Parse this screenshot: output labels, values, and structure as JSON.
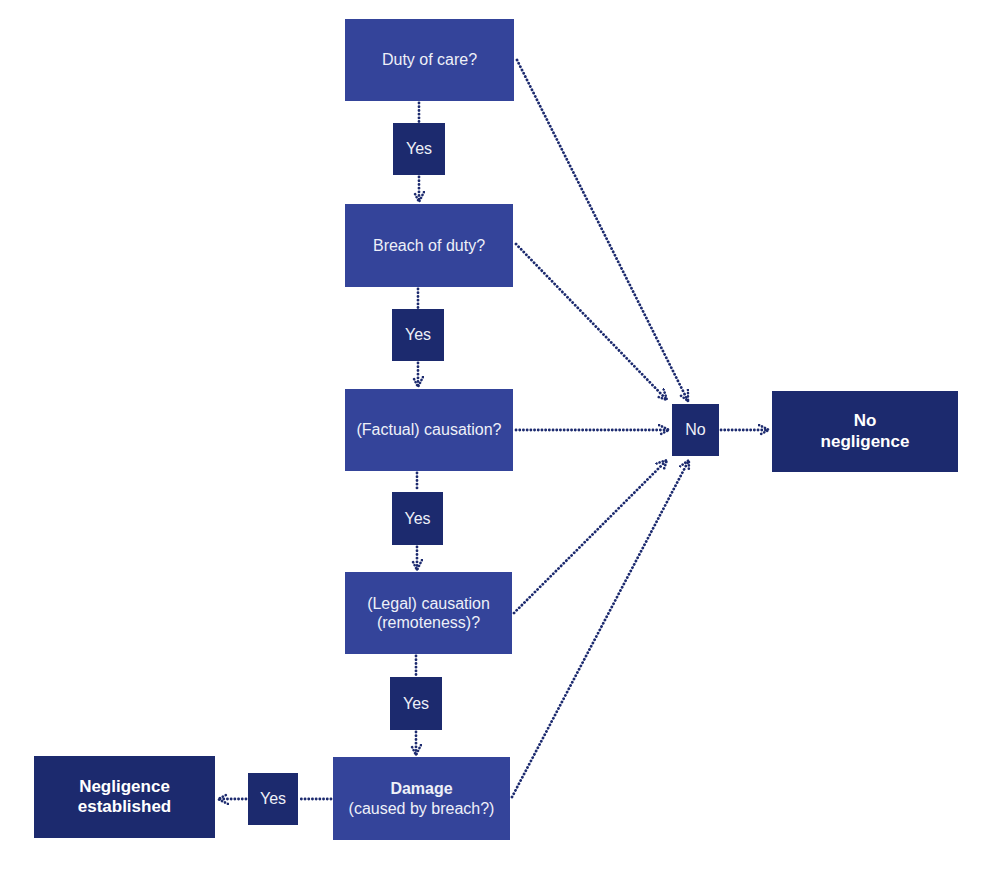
{
  "diagram": {
    "type": "flowchart",
    "colors": {
      "question_box": "#34449a",
      "answer_box": "#1c2a6e",
      "outcome_box": "#1c2a6e",
      "connector": "#1c2a6e",
      "text": "#eef0f8"
    },
    "questions": [
      {
        "id": "duty",
        "label": "Duty of care?"
      },
      {
        "id": "breach",
        "label": "Breach of duty?"
      },
      {
        "id": "factual",
        "label": "(Factual) causation?"
      },
      {
        "id": "legal",
        "line1": "(Legal) causation",
        "line2": "(remoteness)?"
      },
      {
        "id": "damage",
        "line1": "Damage",
        "line2": "(caused by breach?)"
      }
    ],
    "yes_label": "Yes",
    "no_label": "No",
    "outcomes": {
      "negligence_established": {
        "line1": "Negligence",
        "line2": "established"
      },
      "no_negligence": {
        "line1": "No",
        "line2": "negligence"
      }
    },
    "edges": [
      {
        "from": "duty",
        "to": "yes1",
        "style": "dotted"
      },
      {
        "from": "yes1",
        "to": "breach",
        "style": "dotted-arrow"
      },
      {
        "from": "breach",
        "to": "yes2",
        "style": "dotted"
      },
      {
        "from": "yes2",
        "to": "factual",
        "style": "dotted-arrow"
      },
      {
        "from": "factual",
        "to": "yes3",
        "style": "dotted"
      },
      {
        "from": "yes3",
        "to": "legal",
        "style": "dotted-arrow"
      },
      {
        "from": "legal",
        "to": "yes4",
        "style": "dotted"
      },
      {
        "from": "yes4",
        "to": "damage",
        "style": "dotted-arrow"
      },
      {
        "from": "damage",
        "to": "yes5",
        "style": "dotted"
      },
      {
        "from": "yes5",
        "to": "negligence_established",
        "style": "dotted-arrow"
      },
      {
        "from": "duty",
        "to": "no",
        "style": "dotted-arrow"
      },
      {
        "from": "breach",
        "to": "no",
        "style": "dotted-arrow"
      },
      {
        "from": "factual",
        "to": "no",
        "style": "dotted-arrow"
      },
      {
        "from": "legal",
        "to": "no",
        "style": "dotted-arrow"
      },
      {
        "from": "damage",
        "to": "no",
        "style": "dotted-arrow"
      },
      {
        "from": "no",
        "to": "no_negligence",
        "style": "dotted-arrow"
      }
    ]
  }
}
